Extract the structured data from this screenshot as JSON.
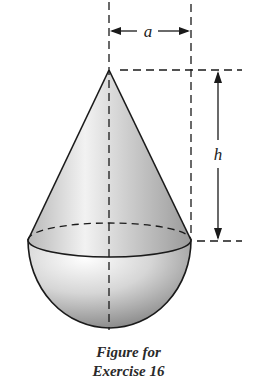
{
  "figure": {
    "labels": {
      "radius": "a",
      "height": "h"
    },
    "shape": "cone on hemisphere",
    "colors": {
      "stroke": "#1a1a1a",
      "shade_dark": "#8a8a8a",
      "shade_light": "#f4f4f4"
    }
  },
  "caption": {
    "line1": "Figure for",
    "line2": "Exercise 16"
  }
}
